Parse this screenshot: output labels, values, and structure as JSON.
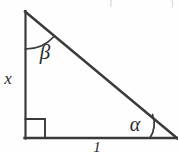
{
  "figure": {
    "kind": "right-triangle-diagram",
    "background_color": "#fefefe",
    "line_color": "#3a3a3a",
    "labels": {
      "vertical_leg": "x",
      "base": "1",
      "apex_angle": "β",
      "base_right_angle": "α"
    },
    "markers": {
      "right_angle": "square",
      "apex_arc": "arc",
      "base_arc": "arc"
    },
    "geometry": {
      "apex": [
        25,
        11
      ],
      "right_angle_vertex": [
        25,
        138
      ],
      "base_right_vertex": [
        176,
        138
      ],
      "right_angle_square_size": 19
    },
    "artifacts": {
      "top_left_mark": "cropped-parenthesis",
      "top_right_mark": "cropped-parenthesis"
    }
  }
}
